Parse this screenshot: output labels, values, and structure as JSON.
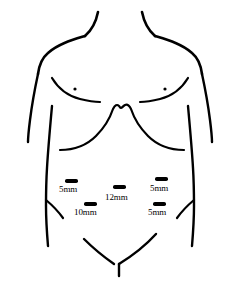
{
  "figure": {
    "view": "anterior torso",
    "background_color": "#ffffff",
    "line_color": "#000000"
  },
  "ports": [
    {
      "id": "left-lateral-port",
      "label": "5mm",
      "size_mm": 5,
      "mark_x": 65,
      "mark_y": 179,
      "mark_width": 13,
      "mark_height": 4,
      "label_x": 59,
      "label_y": 184
    },
    {
      "id": "left-lower-port",
      "label": "10mm",
      "size_mm": 10,
      "mark_x": 84,
      "mark_y": 202,
      "mark_width": 13,
      "mark_height": 4,
      "label_x": 74,
      "label_y": 207
    },
    {
      "id": "umbilical-camera-port",
      "label": "12mm",
      "size_mm": 12,
      "mark_x": 113,
      "mark_y": 185,
      "mark_width": 13,
      "mark_height": 4,
      "label_x": 105,
      "label_y": 192
    },
    {
      "id": "right-upper-port",
      "label": "5mm",
      "size_mm": 5,
      "mark_x": 155,
      "mark_y": 177,
      "mark_width": 13,
      "mark_height": 4,
      "label_x": 150,
      "label_y": 183
    },
    {
      "id": "right-lower-port",
      "label": "5mm",
      "size_mm": 5,
      "mark_x": 153,
      "mark_y": 202,
      "mark_width": 13,
      "mark_height": 4,
      "label_x": 148,
      "label_y": 207
    }
  ],
  "anatomy": {
    "neck_left": "M 98 12 C 96 22 92 30 85 36",
    "neck_right": "M 142 12 C 144 22 148 30 155 36",
    "shoulder_left": "M 85 36 C 72 40 58 44 48 53 C 42 58 39 66 38 74",
    "shoulder_right": "M 155 36 C 168 40 182 44 192 53 C 198 58 201 66 202 74",
    "arm_left": "M 38 74 C 35 88 32 104 30 120 C 29 128 28 136 28 142",
    "arm_right": "M 202 74 C 205 88 208 104 210 120 C 211 128 212 136 212 142",
    "flank_left": "M 52 106 C 50 128 48 150 47 168 C 46 184 46 198 46 206 C 46 220 47 234 48 246",
    "flank_right": "M 188 106 C 190 128 192 150 193 168 C 194 184 194 198 194 206 C 194 220 193 234 192 246",
    "pec_left": "M 52 78 C 58 88 68 96 80 99 C 88 101 94 102 100 102",
    "pec_right": "M 188 78 C 182 88 172 96 160 99 C 152 101 146 102 140 102",
    "costal_margin": "M 60 150 C 72 150 86 146 96 136 C 104 128 110 118 113 109 C 115 105 117 104 119 106 C 120 107 120 108 121 108 C 122 108 123 106 125 105 C 127 104 129 105 131 109 C 134 118 140 128 148 136 C 158 146 172 150 184 150",
    "hip_left": "M 46 200 C 52 205 58 211 63 218",
    "hip_right": "M 194 200 C 188 205 182 211 177 218",
    "groin_left": "M 84 239 C 94 249 104 257 114 264",
    "groin_right": "M 156 234 C 146 245 132 256 119 264",
    "pubic_line": "M 119 264 L 119 276",
    "nipple_left": {
      "cx": 75,
      "cy": 89,
      "r": 1.6
    },
    "nipple_right": {
      "cx": 165,
      "cy": 89,
      "r": 1.6
    }
  }
}
